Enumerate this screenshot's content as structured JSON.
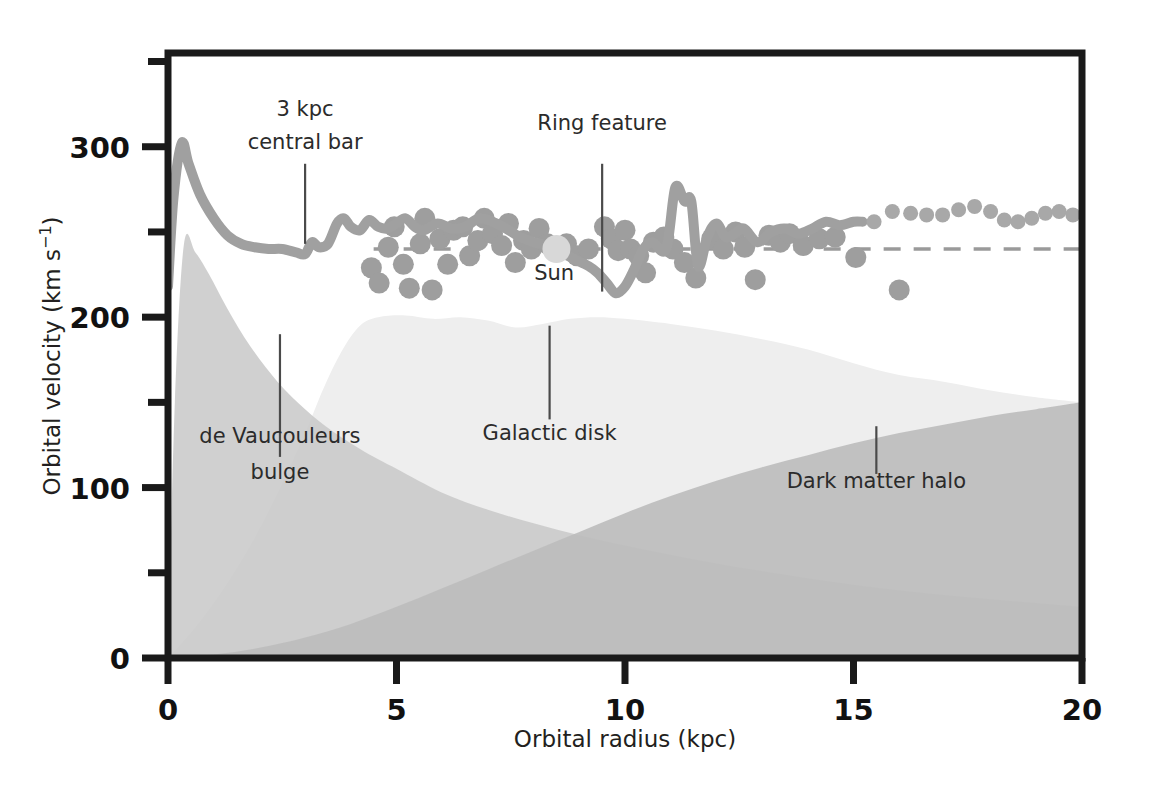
{
  "chart_data": {
    "type": "area",
    "title": "",
    "xlabel": "Orbital radius (kpc)",
    "ylabel": "Orbital velocity (km s⁻¹)",
    "ylabel_main": "Orbital velocity (km s",
    "ylabel_sup": "−1",
    "ylabel_end": ")",
    "xlim": [
      0,
      20
    ],
    "ylim": [
      0,
      355
    ],
    "grid": false,
    "legend": "none (inline annotations)",
    "x_ticks": [
      0,
      5,
      10,
      15,
      20
    ],
    "x_tick_labels": [
      "0",
      "5",
      "10",
      "15",
      "20"
    ],
    "x_minor_ticks": [],
    "y_ticks": [
      0,
      100,
      200,
      300
    ],
    "y_tick_labels": [
      "0",
      "100",
      "200",
      "300"
    ],
    "y_minor_ticks": [
      50,
      150,
      250,
      350
    ],
    "series": [
      {
        "name": "de Vaucouleurs bulge",
        "kind": "filled-area",
        "color": "#c9c9c9",
        "x": [
          0,
          0.15,
          0.35,
          0.6,
          0.9,
          1.3,
          1.8,
          2.4,
          3.0,
          3.6,
          4.3,
          5.0,
          6.0,
          7.0,
          8.0,
          9.0,
          10.0,
          11.5,
          13.0,
          15.0,
          17.0,
          20.0
        ],
        "values": [
          0,
          150,
          243,
          238,
          225,
          205,
          183,
          162,
          146,
          133,
          121,
          111,
          97,
          87,
          79,
          72,
          66,
          58,
          51,
          43,
          37,
          30
        ]
      },
      {
        "name": "Galactic disk",
        "kind": "filled-area",
        "color": "#eeeeee",
        "x": [
          0,
          0.6,
          1.2,
          1.8,
          2.4,
          3.0,
          3.4,
          3.8,
          4.2,
          4.6,
          5.2,
          5.8,
          6.4,
          7.0,
          7.6,
          8.2,
          8.8,
          9.4,
          10.0,
          11.0,
          12.0,
          13.0,
          14.0,
          15.0,
          16.0,
          17.0,
          18.0,
          19.0,
          20.0
        ],
        "values": [
          0,
          18,
          40,
          66,
          97,
          132,
          158,
          180,
          195,
          200,
          201,
          199,
          200,
          198,
          194,
          196,
          199,
          200,
          199,
          196,
          192,
          187,
          181,
          173,
          166,
          162,
          157,
          153,
          150
        ]
      },
      {
        "name": "Dark matter halo",
        "kind": "filled-area",
        "color": "#bdbdbd",
        "x": [
          0,
          1.0,
          2.0,
          3.0,
          4.0,
          5.0,
          6.0,
          7.0,
          8.0,
          9.0,
          10.0,
          11.0,
          12.0,
          13.0,
          14.0,
          15.0,
          16.0,
          17.0,
          18.0,
          19.0,
          20.0
        ],
        "values": [
          0,
          2,
          6,
          12,
          20,
          30,
          41,
          52,
          63,
          74,
          85,
          95,
          104,
          112,
          119,
          126,
          132,
          137,
          142,
          146,
          150
        ]
      },
      {
        "name": "Observed rotation curve (solid)",
        "kind": "line",
        "color": "#a0a0a0",
        "x": [
          0.0,
          0.12,
          0.3,
          0.45,
          0.7,
          1.0,
          1.3,
          1.6,
          1.9,
          2.2,
          2.5,
          2.8,
          3.0,
          3.15,
          3.3,
          3.5,
          3.7,
          3.85,
          4.0,
          4.2,
          4.4,
          4.6,
          4.8,
          5.0,
          5.2,
          5.4,
          5.6,
          5.9,
          6.2,
          6.5,
          6.8,
          7.1,
          7.4,
          7.7,
          8.0,
          8.3,
          8.6,
          8.9,
          9.2,
          9.4,
          9.6,
          9.8,
          10.0,
          10.2,
          10.4,
          10.6,
          10.9,
          11.1,
          11.3,
          11.45,
          11.6,
          11.8,
          12.0,
          12.2,
          12.4,
          12.6,
          12.9,
          13.2,
          13.5,
          13.8,
          14.1,
          14.4,
          14.7,
          15.0,
          15.2
        ],
        "values": [
          218,
          270,
          302,
          290,
          272,
          258,
          248,
          243,
          241,
          240,
          240,
          238,
          237,
          244,
          241,
          243,
          255,
          258,
          253,
          251,
          257,
          253,
          252,
          255,
          258,
          253,
          251,
          255,
          252,
          253,
          258,
          256,
          252,
          247,
          244,
          242,
          238,
          234,
          230,
          226,
          220,
          214,
          218,
          228,
          240,
          244,
          240,
          276,
          268,
          268,
          230,
          247,
          255,
          247,
          249,
          252,
          244,
          250,
          252,
          249,
          252,
          256,
          254,
          256,
          256
        ]
      },
      {
        "name": "Extrapolated rotation curve (dotted)",
        "kind": "dotted",
        "color": "#a8a8a8",
        "x": [
          15.45,
          15.85,
          16.25,
          16.6,
          16.95,
          17.3,
          17.65,
          18.0,
          18.3,
          18.6,
          18.9,
          19.2,
          19.5,
          19.8
        ],
        "values": [
          256,
          262,
          261,
          260,
          260,
          263,
          265,
          262,
          257,
          256,
          258,
          261,
          262,
          260
        ]
      },
      {
        "name": "Flat reference level (dashed)",
        "kind": "dashed-line",
        "color": "#9a9a9a",
        "y_value": 240,
        "x_start": 4.5,
        "x_end": 20
      }
    ],
    "scatter": {
      "name": "Observed tracer measurements",
      "color": "#9e9e9e",
      "marker": "circle",
      "points": [
        [
          4.45,
          229
        ],
        [
          4.62,
          220
        ],
        [
          4.82,
          241
        ],
        [
          4.95,
          253
        ],
        [
          5.15,
          231
        ],
        [
          5.28,
          217
        ],
        [
          5.52,
          243
        ],
        [
          5.62,
          258
        ],
        [
          5.78,
          216
        ],
        [
          5.95,
          246
        ],
        [
          6.12,
          231
        ],
        [
          6.25,
          251
        ],
        [
          6.45,
          253
        ],
        [
          6.6,
          236
        ],
        [
          6.78,
          245
        ],
        [
          6.92,
          258
        ],
        [
          7.1,
          249
        ],
        [
          7.3,
          242
        ],
        [
          7.45,
          255
        ],
        [
          7.6,
          232
        ],
        [
          7.78,
          245
        ],
        [
          7.95,
          240
        ],
        [
          8.12,
          252
        ],
        [
          8.3,
          243
        ],
        [
          8.5,
          240
        ],
        [
          8.72,
          243
        ],
        [
          8.95,
          236
        ],
        [
          9.2,
          240
        ],
        [
          9.55,
          253
        ],
        [
          9.7,
          246
        ],
        [
          9.85,
          239
        ],
        [
          10.0,
          251
        ],
        [
          10.12,
          240
        ],
        [
          10.3,
          236
        ],
        [
          10.45,
          226
        ],
        [
          10.62,
          244
        ],
        [
          10.85,
          247
        ],
        [
          11.05,
          240
        ],
        [
          11.3,
          232
        ],
        [
          11.55,
          223
        ],
        [
          11.9,
          246
        ],
        [
          12.15,
          240
        ],
        [
          12.42,
          250
        ],
        [
          12.62,
          241
        ],
        [
          12.85,
          222
        ],
        [
          13.15,
          248
        ],
        [
          13.4,
          244
        ],
        [
          13.6,
          249
        ],
        [
          13.9,
          242
        ],
        [
          14.25,
          246
        ],
        [
          14.6,
          247
        ],
        [
          15.05,
          235
        ],
        [
          16.0,
          216
        ]
      ]
    },
    "annotations": [
      {
        "id": "central-bar",
        "label_line1": "3 kpc",
        "label_line2": "central bar",
        "x": 3.0,
        "leader_from_v": 290,
        "leader_to_v": 243
      },
      {
        "id": "ring-feature",
        "label_line1": "Ring feature",
        "label_line2": "",
        "x": 9.5,
        "leader_from_v": 290,
        "leader_to_v": 215
      },
      {
        "id": "sun",
        "label_line1": "Sun",
        "label_line2": "",
        "x": 8.5,
        "value": 240,
        "marker": true
      },
      {
        "id": "de-vaucouleurs",
        "label_line1": "de Vaucouleurs",
        "label_line2": "bulge",
        "x": 2.45,
        "leader_from_v": 190,
        "leader_to_v": 118
      },
      {
        "id": "galactic-disk",
        "label_line1": "Galactic disk",
        "label_line2": "",
        "x": 8.35,
        "leader_from_v": 195,
        "leader_to_v": 140
      },
      {
        "id": "dark-matter",
        "label_line1": "Dark matter halo",
        "label_line2": "",
        "x": 15.5,
        "leader_from_v": 136,
        "leader_to_v": 108
      }
    ],
    "colors": {
      "bulge": "#c9c9c9",
      "disk": "#eeeeee",
      "halo": "#bdbdbd",
      "curve": "#a0a0a0",
      "scatter": "#9e9e9e",
      "sun_marker": "#d8d8d8",
      "axis": "#1a1a1a",
      "text": "#231f20",
      "background": "#ffffff"
    }
  }
}
